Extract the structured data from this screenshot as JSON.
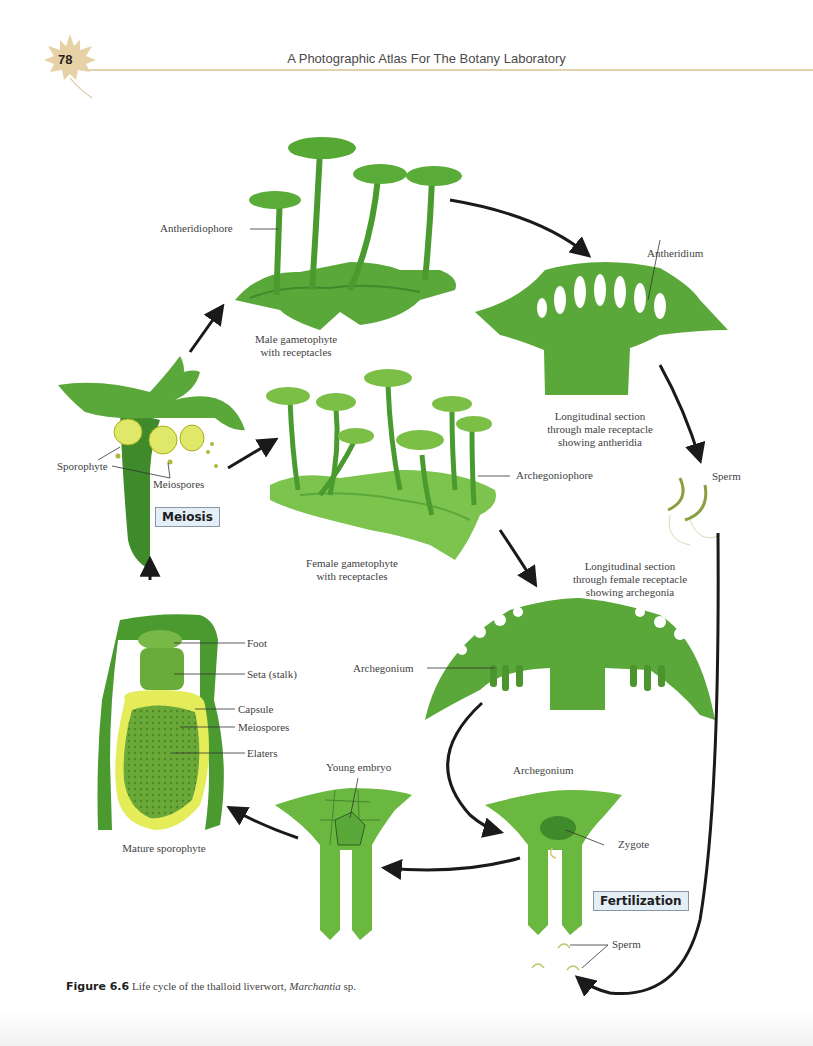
{
  "header": {
    "page_number": "78",
    "book_title": "A Photographic Atlas For The Botany Laboratory",
    "accent_color": "#e2d2b0",
    "icon": "maple-leaf-icon"
  },
  "diagram": {
    "stages": {
      "male_gametophyte": {
        "caption_line1": "Male gametophyte",
        "caption_line2": "with receptacles",
        "label_antheridiophore": "Antheridiophore"
      },
      "male_receptacle_section": {
        "label_antheridium": "Antheridium",
        "caption_line1": "Longitudinal section",
        "caption_line2": "through male receptacle",
        "caption_line3": "showing antheridia"
      },
      "sperm_top": {
        "label": "Sperm"
      },
      "female_gametophyte": {
        "caption_line1": "Female gametophyte",
        "caption_line2": "with receptacles",
        "label_archegoniophore": "Archegoniophore"
      },
      "female_receptacle_section": {
        "caption_line1": "Longitudinal section",
        "caption_line2": "through female receptacle",
        "caption_line3": "showing archegonia",
        "label_archegonium": "Archegonium"
      },
      "sporophyte_release": {
        "label_sporophyte": "Sporophyte",
        "label_meiospores": "Meiospores",
        "process_box": "Meiosis"
      },
      "mature_sporophyte": {
        "caption": "Mature sporophyte",
        "labels": [
          "Foot",
          "Seta (stalk)",
          "Capsule",
          "Meiospores",
          "Elaters"
        ]
      },
      "young_embryo": {
        "label": "Young embryo"
      },
      "archegonium_zygote": {
        "title": "Archegonium",
        "label_zygote": "Zygote",
        "process_box": "Fertilization",
        "label_sperm": "Sperm"
      }
    },
    "colors": {
      "green_dark": "#3f8a2a",
      "green_mid": "#5bab3a",
      "green_light": "#7cc44e",
      "yellow": "#dde65a",
      "arrow": "#1a1a1a",
      "box_fill": "#e4eef6"
    }
  },
  "figure_caption": {
    "label": "Figure 6.6",
    "text": "Life cycle of the thalloid liverwort,",
    "genus": "Marchantia",
    "suffix": "sp."
  }
}
